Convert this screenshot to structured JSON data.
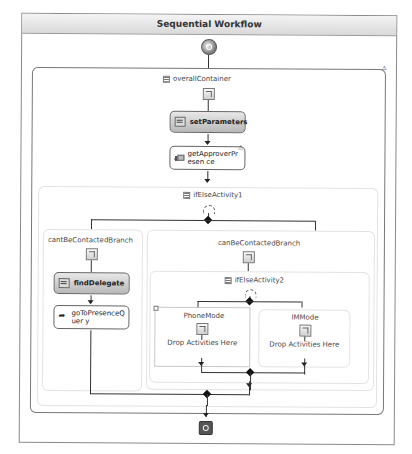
{
  "workflow": {
    "title": "Sequential Workflow",
    "start_icon": "workflow-start-icon",
    "end_icon": "workflow-end-icon"
  },
  "overall_container": {
    "label": "overallContainer",
    "warning_icon": "warning-icon",
    "activities": [
      {
        "name": "setParameters",
        "style": "grey",
        "icon": "code-icon"
      },
      {
        "name": "getApproverPresen ce",
        "style": "white",
        "icon": "invoke-icon",
        "has_warning": true
      }
    ]
  },
  "if_else_1": {
    "label": "ifElseActivity1",
    "branches": [
      {
        "label": "cantBeContactedBranch",
        "activities": [
          {
            "name": "findDelegate",
            "style": "grey",
            "icon": "code-icon"
          },
          {
            "name": "goToPresenceQuer y",
            "style": "white",
            "icon": "goto-icon"
          }
        ]
      },
      {
        "label": "canBeContactedBranch",
        "nested": {
          "label": "ifElseActivity2",
          "branches": [
            {
              "label": "PhoneMode",
              "drop_text": "Drop Activities Here"
            },
            {
              "label": "IMMode",
              "drop_text": "Drop Activities Here"
            }
          ]
        }
      }
    ]
  }
}
